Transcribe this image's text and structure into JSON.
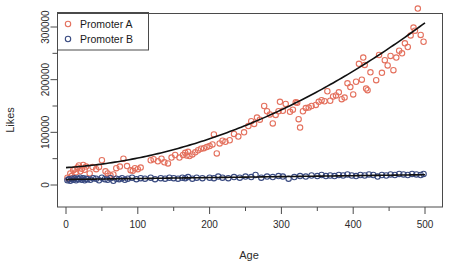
{
  "chart_data": {
    "type": "scatter",
    "title": "",
    "xlabel": "Age",
    "ylabel": "Likes",
    "xlim": [
      -10,
      510
    ],
    "ylim": [
      -12000,
      345000
    ],
    "xticks": [
      0,
      100,
      200,
      300,
      400,
      500
    ],
    "xtick_labels": [
      "0",
      "100",
      "200",
      "300",
      "400",
      "500"
    ],
    "xminorticks": [
      50,
      150,
      250,
      350,
      450
    ],
    "yticks": [
      0,
      100000,
      200000,
      300000
    ],
    "ytick_labels": [
      "0",
      "100000",
      "200000",
      "300000"
    ],
    "yminorticks": [
      50000,
      150000,
      250000
    ],
    "grid": false,
    "legend_position": "top-left",
    "legend_frame": true,
    "series": [
      {
        "name": "Promoter A",
        "marker": "open-circle",
        "color": "#E4715E",
        "fit": "quadratic",
        "fit_color": "#111111",
        "fit_coefficients": [
          33000,
          90,
          0.92
        ],
        "points": [
          [
            2,
            14000
          ],
          [
            4,
            11000
          ],
          [
            6,
            22000
          ],
          [
            8,
            17000
          ],
          [
            10,
            28000
          ],
          [
            12,
            30000
          ],
          [
            14,
            24000
          ],
          [
            16,
            33000
          ],
          [
            18,
            37000
          ],
          [
            20,
            26000
          ],
          [
            22,
            31000
          ],
          [
            24,
            38000
          ],
          [
            26,
            29000
          ],
          [
            28,
            35000
          ],
          [
            33,
            22000
          ],
          [
            37,
            34000
          ],
          [
            42,
            30000
          ],
          [
            46,
            34000
          ],
          [
            50,
            47000
          ],
          [
            55,
            26000
          ],
          [
            58,
            22000
          ],
          [
            62,
            18000
          ],
          [
            66,
            20000
          ],
          [
            70,
            32000
          ],
          [
            75,
            35000
          ],
          [
            80,
            50000
          ],
          [
            85,
            36000
          ],
          [
            90,
            28000
          ],
          [
            93,
            27000
          ],
          [
            96,
            32000
          ],
          [
            100,
            30000
          ],
          [
            104,
            33000
          ],
          [
            118,
            47000
          ],
          [
            122,
            49000
          ],
          [
            128,
            45000
          ],
          [
            133,
            50000
          ],
          [
            137,
            43000
          ],
          [
            142,
            41000
          ],
          [
            147,
            52000
          ],
          [
            152,
            57000
          ],
          [
            158,
            52000
          ],
          [
            163,
            57000
          ],
          [
            166,
            61000
          ],
          [
            168,
            56000
          ],
          [
            170,
            63000
          ],
          [
            172,
            55000
          ],
          [
            176,
            58000
          ],
          [
            180,
            62000
          ],
          [
            184,
            66000
          ],
          [
            188,
            69000
          ],
          [
            192,
            70000
          ],
          [
            196,
            72000
          ],
          [
            200,
            74000
          ],
          [
            204,
            77000
          ],
          [
            206,
            96000
          ],
          [
            210,
            60000
          ],
          [
            214,
            79000
          ],
          [
            218,
            84000
          ],
          [
            222,
            82000
          ],
          [
            228,
            85000
          ],
          [
            234,
            97000
          ],
          [
            240,
            92000
          ],
          [
            248,
            100000
          ],
          [
            254,
            112000
          ],
          [
            258,
            121000
          ],
          [
            262,
            116000
          ],
          [
            266,
            128000
          ],
          [
            270,
            124000
          ],
          [
            276,
            150000
          ],
          [
            280,
            140000
          ],
          [
            284,
            134000
          ],
          [
            288,
            117000
          ],
          [
            292,
            133000
          ],
          [
            296,
            140000
          ],
          [
            298,
            158000
          ],
          [
            302,
            141000
          ],
          [
            306,
            154000
          ],
          [
            312,
            139000
          ],
          [
            316,
            143000
          ],
          [
            320,
            157000
          ],
          [
            322,
            156000
          ],
          [
            324,
            125000
          ],
          [
            326,
            109000
          ],
          [
            330,
            140000
          ],
          [
            334,
            146000
          ],
          [
            338,
            147000
          ],
          [
            342,
            150000
          ],
          [
            348,
            152000
          ],
          [
            352,
            158000
          ],
          [
            356,
            161000
          ],
          [
            360,
            159000
          ],
          [
            364,
            178000
          ],
          [
            368,
            160000
          ],
          [
            372,
            168000
          ],
          [
            376,
            170000
          ],
          [
            380,
            176000
          ],
          [
            384,
            163000
          ],
          [
            388,
            166000
          ],
          [
            392,
            193000
          ],
          [
            396,
            186000
          ],
          [
            400,
            172000
          ],
          [
            404,
            196000
          ],
          [
            408,
            230000
          ],
          [
            412,
            200000
          ],
          [
            414,
            242000
          ],
          [
            416,
            228000
          ],
          [
            418,
            183000
          ],
          [
            420,
            180000
          ],
          [
            424,
            214000
          ],
          [
            432,
            199000
          ],
          [
            436,
            247000
          ],
          [
            440,
            213000
          ],
          [
            444,
            237000
          ],
          [
            448,
            227000
          ],
          [
            452,
            245000
          ],
          [
            456,
            218000
          ],
          [
            460,
            242000
          ],
          [
            464,
            255000
          ],
          [
            468,
            250000
          ],
          [
            472,
            269000
          ],
          [
            476,
            262000
          ],
          [
            480,
            284000
          ],
          [
            484,
            299000
          ],
          [
            486,
            293000
          ],
          [
            490,
            335000
          ],
          [
            494,
            285000
          ],
          [
            498,
            272000
          ]
        ]
      },
      {
        "name": "Promoter B",
        "marker": "open-circle",
        "color": "#394A80",
        "fit": "linear",
        "fit_color": "#111111",
        "fit_coefficients": [
          10500,
          18
        ],
        "points": [
          [
            2,
            9000
          ],
          [
            4,
            11000
          ],
          [
            6,
            8000
          ],
          [
            8,
            12000
          ],
          [
            10,
            10000
          ],
          [
            12,
            13000
          ],
          [
            14,
            9000
          ],
          [
            16,
            12000
          ],
          [
            18,
            11000
          ],
          [
            20,
            14000
          ],
          [
            22,
            10000
          ],
          [
            24,
            13000
          ],
          [
            26,
            9000
          ],
          [
            28,
            12000
          ],
          [
            30,
            11000
          ],
          [
            34,
            10000
          ],
          [
            38,
            13000
          ],
          [
            42,
            12000
          ],
          [
            46,
            9000
          ],
          [
            50,
            14000
          ],
          [
            54,
            11000
          ],
          [
            58,
            10000
          ],
          [
            62,
            13000
          ],
          [
            66,
            8000
          ],
          [
            70,
            12000
          ],
          [
            74,
            11000
          ],
          [
            78,
            13000
          ],
          [
            82,
            10000
          ],
          [
            86,
            12000
          ],
          [
            92,
            14000
          ],
          [
            98,
            11000
          ],
          [
            104,
            13000
          ],
          [
            110,
            12000
          ],
          [
            118,
            14000
          ],
          [
            124,
            11000
          ],
          [
            132,
            13000
          ],
          [
            138,
            12000
          ],
          [
            144,
            14000
          ],
          [
            150,
            13000
          ],
          [
            156,
            12000
          ],
          [
            162,
            14000
          ],
          [
            166,
            13000
          ],
          [
            170,
            15000
          ],
          [
            176,
            12000
          ],
          [
            182,
            14000
          ],
          [
            190,
            13000
          ],
          [
            200,
            14000
          ],
          [
            206,
            13000
          ],
          [
            212,
            16000
          ],
          [
            218,
            14000
          ],
          [
            226,
            13000
          ],
          [
            234,
            15000
          ],
          [
            242,
            14000
          ],
          [
            250,
            16000
          ],
          [
            258,
            15000
          ],
          [
            264,
            19000
          ],
          [
            272,
            14000
          ],
          [
            280,
            16000
          ],
          [
            288,
            15000
          ],
          [
            296,
            17000
          ],
          [
            302,
            16000
          ],
          [
            310,
            12000
          ],
          [
            318,
            15000
          ],
          [
            326,
            17000
          ],
          [
            334,
            16000
          ],
          [
            342,
            18000
          ],
          [
            350,
            17000
          ],
          [
            356,
            19000
          ],
          [
            362,
            17000
          ],
          [
            368,
            18000
          ],
          [
            374,
            17000
          ],
          [
            380,
            19000
          ],
          [
            386,
            18000
          ],
          [
            392,
            20000
          ],
          [
            398,
            18000
          ],
          [
            404,
            17000
          ],
          [
            410,
            19000
          ],
          [
            416,
            18000
          ],
          [
            422,
            20000
          ],
          [
            428,
            19000
          ],
          [
            434,
            16000
          ],
          [
            440,
            19000
          ],
          [
            446,
            18000
          ],
          [
            452,
            20000
          ],
          [
            458,
            19000
          ],
          [
            464,
            21000
          ],
          [
            470,
            20000
          ],
          [
            476,
            19000
          ],
          [
            482,
            21000
          ],
          [
            488,
            20000
          ],
          [
            494,
            19000
          ],
          [
            498,
            21000
          ]
        ]
      }
    ]
  },
  "legend": {
    "entries": [
      {
        "label": "Promoter A",
        "color": "#E4715E"
      },
      {
        "label": "Promoter B",
        "color": "#394A80"
      }
    ]
  }
}
